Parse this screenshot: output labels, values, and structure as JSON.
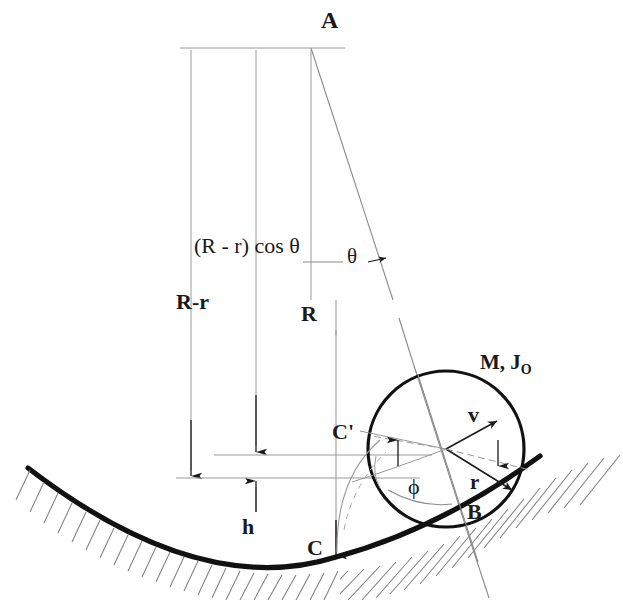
{
  "figure": {
    "background_color": "#ffffff",
    "ink_color": "#1a1a1a",
    "thin_line_color": "#8a8a8a"
  },
  "labels": {
    "apex": "A",
    "chord_projection": "(R - r) cos θ",
    "radius_difference": "R-r",
    "trough_radius": "R",
    "swing_angle": "θ",
    "mass_inertia": "M, J",
    "mass_inertia_sub": "O",
    "velocity": "v",
    "cylinder_radius": "r",
    "roll_angle": "ϕ",
    "contact_point": "B",
    "contact_mark_prime": "C'",
    "trough_bottom": "C",
    "height": "h"
  },
  "geometry": {
    "apex_point": [
      311,
      48
    ],
    "circle_center": [
      446,
      449
    ],
    "circle_radius": 78,
    "contact_point_B": [
      494,
      510
    ],
    "trough_bottom_C": [
      336,
      557
    ],
    "c_prime_point": [
      377,
      438
    ],
    "vertical_lines_x": [
      191,
      256,
      311
    ],
    "vertical_lines_top_y": 48,
    "horizontal_ref_lines_y": [
      455,
      478
    ],
    "hatch_side_left": "below-left",
    "hatch_side_right": "below-right"
  }
}
